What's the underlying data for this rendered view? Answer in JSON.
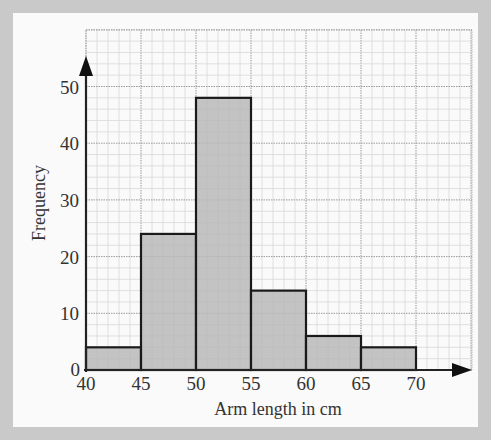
{
  "chart_data": {
    "type": "bar",
    "subtype": "histogram",
    "title": "",
    "xlabel": "Arm length in cm",
    "ylabel": "Frequency",
    "bins": [
      {
        "from": 40,
        "to": 45,
        "frequency": 4
      },
      {
        "from": 45,
        "to": 50,
        "frequency": 24
      },
      {
        "from": 50,
        "to": 55,
        "frequency": 48
      },
      {
        "from": 55,
        "to": 60,
        "frequency": 14
      },
      {
        "from": 60,
        "to": 65,
        "frequency": 6
      },
      {
        "from": 65,
        "to": 70,
        "frequency": 4
      }
    ],
    "categories": [
      "40-45",
      "45-50",
      "50-55",
      "55-60",
      "60-65",
      "65-70"
    ],
    "values": [
      4,
      24,
      48,
      14,
      6,
      4
    ],
    "x_ticks": [
      "40",
      "45",
      "50",
      "55",
      "60",
      "65",
      "70"
    ],
    "y_ticks": [
      "0",
      "10",
      "20",
      "30",
      "40",
      "50"
    ],
    "xlim": [
      40,
      75
    ],
    "ylim": [
      0,
      55
    ],
    "grid": true,
    "bar_color": "#b8b8b8",
    "edge_color": "#1a1a1a"
  }
}
